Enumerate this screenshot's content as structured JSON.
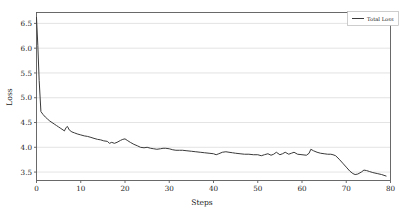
{
  "chart_data": {
    "type": "line",
    "title": "",
    "xlabel": "Steps",
    "ylabel": "Loss",
    "xlim": [
      0,
      80
    ],
    "ylim": [
      3.33,
      6.72
    ],
    "grid": true,
    "grid_axis": "y",
    "legend_position": "upper right",
    "line_color": "#3a3a3a",
    "grid_color": "#dcdcdc",
    "axes_color": "#5a5a5a",
    "background_color": "#ffffff",
    "xticks": [
      0,
      10,
      20,
      30,
      40,
      50,
      60,
      70,
      80
    ],
    "xticklabels": [
      "0",
      "10",
      "20",
      "30",
      "40",
      "50",
      "60",
      "70",
      "80"
    ],
    "yticks": [
      3.5,
      4.0,
      4.5,
      5.0,
      5.5,
      6.0,
      6.5
    ],
    "yticklabels": [
      "3.5",
      "4.0",
      "4.5",
      "5.0",
      "5.5",
      "6.0",
      "6.5"
    ],
    "series": [
      {
        "name": "Total Loss",
        "x": [
          0,
          0.3,
          0.6,
          1,
          1.5,
          2,
          2.5,
          3,
          3.5,
          4,
          4.5,
          5,
          5.5,
          6,
          6.3,
          6.7,
          7,
          7.4,
          8,
          8.6,
          9.2,
          10,
          10.8,
          11.5,
          12.3,
          13,
          13.8,
          14.5,
          15.2,
          16,
          16.5,
          17,
          17.6,
          18.2,
          19,
          19.5,
          20,
          20.5,
          21.2,
          22,
          22.8,
          23.5,
          24.3,
          25,
          25.8,
          26.5,
          27.2,
          28,
          28.6,
          29.2,
          30,
          30.8,
          31.5,
          32.3,
          33,
          34,
          35,
          36,
          37,
          38,
          39,
          40,
          40.6,
          41.2,
          42,
          42.8,
          43.5,
          44.3,
          45,
          46,
          47,
          48,
          49,
          50,
          50.8,
          51.5,
          52.3,
          53,
          53.6,
          54.2,
          55,
          55.6,
          56.2,
          57,
          57.6,
          58.2,
          59,
          60,
          61,
          61.6,
          62,
          62.6,
          63.4,
          64.2,
          65,
          65.8,
          66.5,
          67,
          67.6,
          68.4,
          69.2,
          70,
          70.8,
          71.5,
          72,
          72.6,
          73.4,
          74,
          74.6,
          75.3,
          76,
          77,
          78,
          79
        ],
        "y": [
          6.62,
          6.05,
          5.35,
          4.72,
          4.66,
          4.61,
          4.57,
          4.53,
          4.5,
          4.47,
          4.44,
          4.41,
          4.38,
          4.35,
          4.33,
          4.4,
          4.42,
          4.35,
          4.31,
          4.29,
          4.27,
          4.25,
          4.23,
          4.22,
          4.2,
          4.18,
          4.16,
          4.15,
          4.13,
          4.12,
          4.08,
          4.1,
          4.08,
          4.1,
          4.14,
          4.16,
          4.17,
          4.14,
          4.1,
          4.06,
          4.03,
          4.0,
          3.99,
          4.0,
          3.98,
          3.97,
          3.96,
          3.97,
          3.98,
          3.98,
          3.97,
          3.95,
          3.94,
          3.94,
          3.94,
          3.93,
          3.92,
          3.91,
          3.9,
          3.89,
          3.88,
          3.87,
          3.85,
          3.87,
          3.9,
          3.91,
          3.9,
          3.89,
          3.88,
          3.87,
          3.86,
          3.86,
          3.85,
          3.85,
          3.83,
          3.85,
          3.87,
          3.84,
          3.86,
          3.9,
          3.85,
          3.87,
          3.9,
          3.86,
          3.88,
          3.9,
          3.86,
          3.85,
          3.84,
          3.88,
          3.96,
          3.93,
          3.9,
          3.88,
          3.87,
          3.86,
          3.86,
          3.85,
          3.83,
          3.76,
          3.68,
          3.6,
          3.52,
          3.47,
          3.45,
          3.46,
          3.5,
          3.54,
          3.53,
          3.51,
          3.49,
          3.47,
          3.45,
          3.42
        ]
      }
    ]
  },
  "legend": {
    "entries": [
      {
        "label": "Total Loss",
        "color": "#3a3a3a"
      }
    ]
  }
}
